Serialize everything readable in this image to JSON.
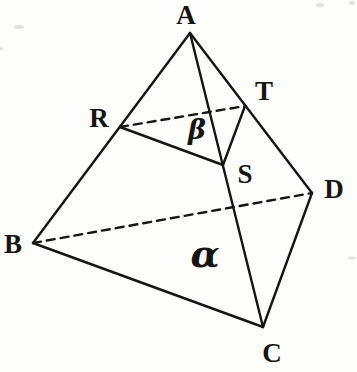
{
  "figure": {
    "canvas": {
      "width": 357,
      "height": 372,
      "background": "#fdfdfc"
    },
    "style": {
      "line_color": "#171512",
      "line_width": 2.4,
      "dash_pattern": "8 6",
      "label_font_size": 27
    },
    "points": {
      "A": {
        "x": 190,
        "y": 33
      },
      "B": {
        "x": 33,
        "y": 243
      },
      "C": {
        "x": 263,
        "y": 327
      },
      "D": {
        "x": 312,
        "y": 193
      },
      "R": {
        "x": 120,
        "y": 127
      },
      "S": {
        "x": 223,
        "y": 165
      },
      "T": {
        "x": 245,
        "y": 106
      }
    },
    "edges": [
      {
        "id": "edge-AB",
        "from": "A",
        "to": "B",
        "style": "solid"
      },
      {
        "id": "edge-AC",
        "from": "A",
        "to": "C",
        "style": "solid"
      },
      {
        "id": "edge-AD",
        "from": "A",
        "to": "D",
        "style": "solid"
      },
      {
        "id": "edge-BC",
        "from": "B",
        "to": "C",
        "style": "solid"
      },
      {
        "id": "edge-CD",
        "from": "C",
        "to": "D",
        "style": "solid"
      },
      {
        "id": "edge-BD",
        "from": "B",
        "to": "D",
        "style": "dashed"
      },
      {
        "id": "segment-RS",
        "from": "R",
        "to": "S",
        "style": "solid"
      },
      {
        "id": "segment-ST",
        "from": "S",
        "to": "T",
        "style": "solid"
      },
      {
        "id": "segment-RT",
        "from": "R",
        "to": "T",
        "style": "dashed"
      }
    ],
    "vertex_labels": [
      {
        "text": "A",
        "x": 186,
        "y": 24,
        "font_size": 27
      },
      {
        "text": "B",
        "x": 13,
        "y": 253,
        "font_size": 27
      },
      {
        "text": "C",
        "x": 272,
        "y": 362,
        "font_size": 27
      },
      {
        "text": "D",
        "x": 334,
        "y": 198,
        "font_size": 27
      },
      {
        "text": "R",
        "x": 99,
        "y": 127,
        "font_size": 27
      },
      {
        "text": "S",
        "x": 245,
        "y": 183,
        "font_size": 27
      },
      {
        "text": "T",
        "x": 264,
        "y": 100,
        "font_size": 27
      }
    ],
    "plane_labels": [
      {
        "text": "β",
        "name": "plane-beta-label",
        "x": 197,
        "y": 139,
        "font_size": 27
      },
      {
        "text": "α",
        "name": "plane-alpha-label",
        "x": 205,
        "y": 267,
        "font_size": 38
      }
    ],
    "artifacts": [
      {
        "x": 19,
        "y": 27,
        "rx": 5,
        "ry": 2
      },
      {
        "x": 320,
        "y": 5,
        "rx": 4,
        "ry": 2
      },
      {
        "x": 352,
        "y": 3,
        "rx": 3,
        "ry": 2
      },
      {
        "x": 1,
        "y": 49,
        "rx": 2,
        "ry": 1.5
      },
      {
        "x": 352,
        "y": 258,
        "rx": 4,
        "ry": 1.5
      }
    ]
  }
}
